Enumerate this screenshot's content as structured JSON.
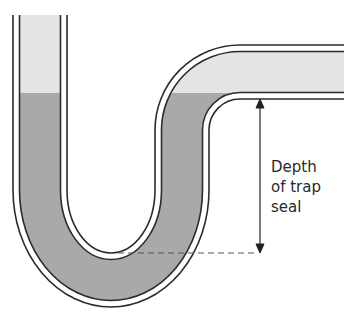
{
  "diagram": {
    "label_lines": [
      "Depth",
      "of trap",
      "seal"
    ],
    "colors": {
      "water": "#a9a9a9",
      "air": "#e4e4e4",
      "pipe_wall": "#2b2b2b",
      "background": "#ffffff"
    },
    "components": [
      "inlet-pipe",
      "u-trap",
      "outlet-pipe",
      "water-seal",
      "depth-arrow",
      "dashed-reference-line"
    ]
  }
}
